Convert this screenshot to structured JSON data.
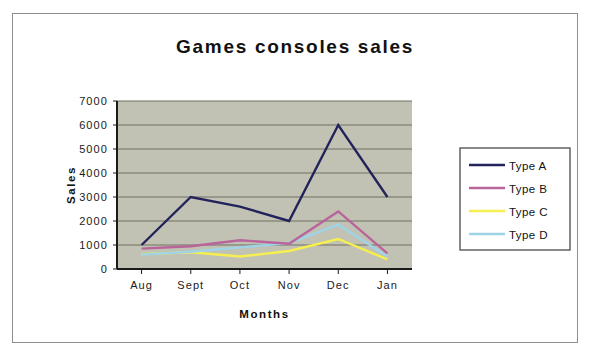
{
  "chart_data": {
    "type": "line",
    "title": "Games consoles sales",
    "xlabel": "Months",
    "ylabel": "Sales",
    "categories": [
      "Aug",
      "Sept",
      "Oct",
      "Nov",
      "Dec",
      "Jan"
    ],
    "ylim": [
      0,
      7000
    ],
    "ytick_step": 1000,
    "yticks": [
      "7000",
      "6000",
      "5000",
      "4000",
      "3000",
      "2000",
      "1000",
      "0"
    ],
    "grid": true,
    "legend_position": "right",
    "series": [
      {
        "name": "Type A",
        "color": "#23235c",
        "values": [
          1000,
          3000,
          2600,
          2000,
          6000,
          3000
        ]
      },
      {
        "name": "Type B",
        "color": "#b9649a",
        "values": [
          850,
          950,
          1200,
          1050,
          2400,
          650
        ]
      },
      {
        "name": "Type C",
        "color": "#f5ef50",
        "values": [
          620,
          700,
          520,
          750,
          1250,
          400
        ]
      },
      {
        "name": "Type D",
        "color": "#9fd4e8",
        "values": [
          600,
          720,
          900,
          1080,
          1850,
          520
        ]
      }
    ]
  },
  "style": {
    "plot_background": "#c2c2b4",
    "gridline_color": "#6e6e63",
    "axis_color": "#1a1a1a",
    "frame_border": "#8e8e8e",
    "legend_border": "#4a4a4a"
  }
}
